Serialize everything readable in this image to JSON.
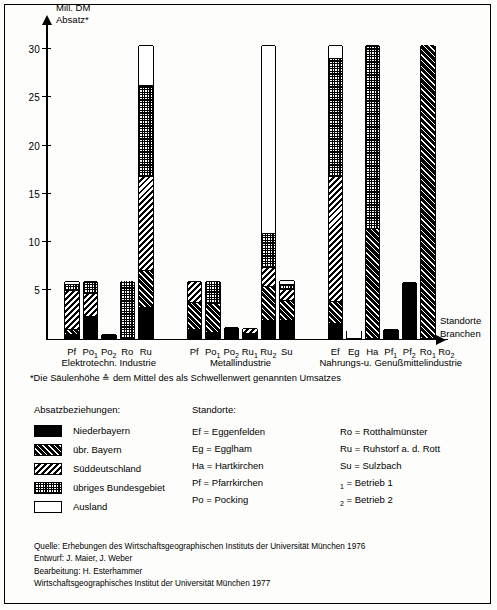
{
  "chart_data": {
    "type": "bar",
    "stacked": true,
    "title": "",
    "ylabel": "Mill. DM Absatz*",
    "y_axis_caption_line1": "Mill. DM",
    "y_axis_caption_line2": "Absatz*",
    "xlabel_line1": "Standorte",
    "xlabel_line2": "Branchen",
    "ylim": [
      0,
      32
    ],
    "yticks": [
      5,
      10,
      15,
      20,
      25,
      30
    ],
    "grid": false,
    "legend_position": "below-left",
    "series": [
      {
        "name": "Niederbayern",
        "pattern": "p-black"
      },
      {
        "name": "übr. Bayern",
        "pattern": "p-cross"
      },
      {
        "name": "Süddeutschland",
        "pattern": "p-diag"
      },
      {
        "name": "übriges Bundesgebiet",
        "pattern": "p-dots"
      },
      {
        "name": "Ausland",
        "pattern": "p-white"
      }
    ],
    "groups": [
      {
        "label": "Elektrotechn. Industrie",
        "bars": [
          {
            "label": "Pf",
            "sub": "",
            "values": [
              0.4,
              0.5,
              4.0,
              0.6,
              0.4
            ],
            "total": 5.9
          },
          {
            "label": "Po",
            "sub": "1",
            "values": [
              2.2,
              0.0,
              2.4,
              1.3,
              0.0
            ],
            "total": 5.9
          },
          {
            "label": "Po",
            "sub": "2",
            "values": [
              0.4,
              0.0,
              0.0,
              0.0,
              0.0
            ],
            "total": 0.4
          },
          {
            "label": "Ro",
            "sub": "",
            "values": [
              0.0,
              0.0,
              0.0,
              5.9,
              0.0
            ],
            "total": 5.9
          },
          {
            "label": "Ru",
            "sub": "",
            "values": [
              3.2,
              3.8,
              9.8,
              9.4,
              4.1
            ],
            "total": 30.3
          }
        ]
      },
      {
        "label": "Metallindustrie",
        "bars": [
          {
            "label": "Pf",
            "sub": "",
            "values": [
              0.9,
              2.8,
              2.2,
              0.0,
              0.0
            ],
            "total": 5.9
          },
          {
            "label": "Po",
            "sub": "1",
            "values": [
              0.6,
              3.0,
              0.0,
              2.3,
              0.0
            ],
            "total": 5.9
          },
          {
            "label": "Po",
            "sub": "2",
            "values": [
              1.1,
              0.0,
              0.0,
              0.0,
              0.0
            ],
            "total": 1.1
          },
          {
            "label": "Ru",
            "sub": "1",
            "values": [
              0.5,
              0.0,
              0.5,
              0.0,
              0.0
            ],
            "total": 1.0
          },
          {
            "label": "Ru",
            "sub": "2",
            "values": [
              1.8,
              3.5,
              2.0,
              3.5,
              19.5
            ],
            "total": 30.3
          },
          {
            "label": "Su",
            "sub": "",
            "values": [
              1.8,
              2.1,
              1.1,
              0.6,
              0.4
            ],
            "total": 6.0
          }
        ]
      },
      {
        "label": "Nahrungs-u. Genußmittelindustrie",
        "bars": [
          {
            "label": "Ef",
            "sub": "",
            "values": [
              1.5,
              2.3,
              13.0,
              12.2,
              1.3
            ],
            "total": 30.3
          },
          {
            "label": "Eg",
            "sub": "",
            "values": [
              0.0,
              0.0,
              0.0,
              0.0,
              0.8
            ],
            "total": 0.8
          },
          {
            "label": "Ha",
            "sub": "",
            "values": [
              0.0,
              11.3,
              0.0,
              19.0,
              0.0
            ],
            "total": 30.3
          },
          {
            "label": "Pf",
            "sub": "1",
            "values": [
              0.9,
              0.0,
              0.0,
              0.0,
              0.0
            ],
            "total": 0.9
          },
          {
            "label": "Pf",
            "sub": "2",
            "values": [
              5.8,
              0.0,
              0.0,
              0.0,
              0.0
            ],
            "total": 5.8
          },
          {
            "label": "Ro",
            "sub": "1",
            "values": [
              0.0,
              30.3,
              0.0,
              0.0,
              0.0
            ],
            "total": 30.3
          },
          {
            "label": "Ro",
            "sub": "2",
            "values": [
              0.0,
              0.0,
              0.0,
              0.0,
              0.0
            ],
            "total": 0.0
          }
        ]
      }
    ]
  },
  "footnote": "*Die Säulenhöhe ≙ dem Mittel des als Schwellenwert genannten Umsatzes",
  "legend": {
    "title": "Absatzbeziehungen:",
    "items": [
      {
        "label": "Niederbayern"
      },
      {
        "label": "übr. Bayern"
      },
      {
        "label": "Süddeutschland"
      },
      {
        "label": "übriges Bundesgebiet"
      },
      {
        "label": "Ausland"
      }
    ]
  },
  "places": {
    "title": "Standorte:",
    "col1": [
      "Ef = Eggenfelden",
      "Eg = Egglham",
      "Ha = Hartkirchen",
      "Pf = Pfarrkirchen",
      "Po = Pocking"
    ],
    "col2": [
      "Ro = Rotthalmünster",
      "Ru = Ruhstorf a. d. Rott",
      "Su = Sulzbach"
    ],
    "notes": [
      {
        "sub": "1",
        "text": " = Betrieb 1"
      },
      {
        "sub": "2",
        "text": " = Betrieb 2"
      }
    ]
  },
  "source": {
    "line1": "Quelle: Erhebungen des Wirtschaftsgeographischen Instituts der Universität München 1976",
    "line2": "Entwurf: J. Maier, J. Weber",
    "line3": "Bearbeitung: H. Esterhammer",
    "line4": "Wirtschaftsgeographisches Institut der Universität München 1977"
  }
}
